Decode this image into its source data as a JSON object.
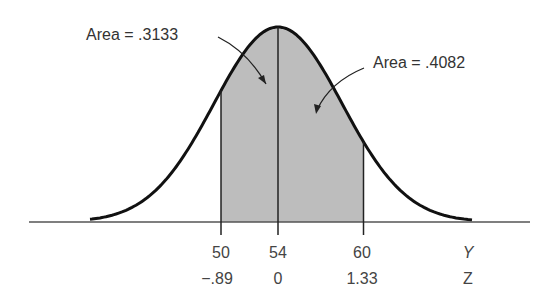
{
  "figure": {
    "annotations": [
      {
        "text": "Area = .3133",
        "x": 86,
        "y": 40
      },
      {
        "text": "Area = .4082",
        "x": 373,
        "y": 68
      }
    ],
    "y_axis_name": "Y",
    "z_axis_name": "Z",
    "y_ticks": [
      "50",
      "54",
      "60"
    ],
    "z_ticks": [
      "−.89",
      "0",
      "1.33"
    ],
    "colors": {
      "curve": "#111111",
      "shade": "#bdbdbd",
      "axis": "#555555",
      "text": "#333333"
    }
  },
  "chart_data": {
    "type": "area",
    "title": "",
    "mean": 54,
    "sd": 4.5,
    "shaded_regions": [
      {
        "from_y": 50,
        "to_y": 54,
        "from_z": -0.89,
        "to_z": 0,
        "area": 0.3133,
        "label": "Area = .3133"
      },
      {
        "from_y": 54,
        "to_y": 60,
        "from_z": 0,
        "to_z": 1.33,
        "area": 0.4082,
        "label": "Area = .4082"
      }
    ],
    "x_tick_values_y": [
      50,
      54,
      60
    ],
    "x_tick_values_z": [
      -0.89,
      0,
      1.33
    ],
    "xlabel": "Y",
    "xlabel_secondary": "Z",
    "grid": false
  }
}
